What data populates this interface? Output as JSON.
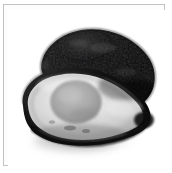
{
  "image": {
    "subject": "avocado cut in half",
    "caption": "Grayscale photograph of an avocado sliced in half, showing the dark outer skin half behind and the pale cut half with its round pit cavity in front, resting on a white surface with a soft shadow.",
    "palette": "grayscale",
    "background_color": "#ffffff",
    "frame_color": "#c3c3c3",
    "shadow_color": "#b8b8b8",
    "parts": {
      "skin_half": {
        "name": "dark-skin-half",
        "fill_dark": "#0b0b0b",
        "fill_mid": "#222222",
        "highlight": "#4a4a4a"
      },
      "cut_half": {
        "name": "cut-flesh-half",
        "flesh_light": "#e2e2e2",
        "flesh_mid": "#c9c9c9",
        "rim_dark": "#171717",
        "rim_mid": "#5a5a5a"
      },
      "pit_cavity": {
        "name": "pit-cavity",
        "fill": "#a9a9a9",
        "edge": "#8d8d8d"
      }
    }
  },
  "frame": {
    "border_label": "photo-frame",
    "width_px": 162,
    "height_px": 162
  },
  "canvas": {
    "width_px": 172,
    "height_px": 173
  }
}
